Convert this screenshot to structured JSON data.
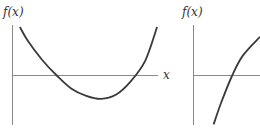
{
  "chart_data": [
    {
      "type": "line",
      "title": "",
      "ylabel": "f(x)",
      "xlabel": "x",
      "grid": false,
      "description": "Upward-opening parabola crossing the x-axis twice with a minimum below the axis",
      "xlim": [
        0,
        10
      ],
      "ylim": [
        -3,
        5
      ],
      "series": [
        {
          "name": "f(x)",
          "x": [
            0.5,
            1.0,
            2.0,
            3.0,
            4.0,
            5.0,
            6.0,
            7.0,
            8.0,
            9.0,
            9.8
          ],
          "y": [
            4.9,
            3.6,
            1.6,
            0.0,
            -1.3,
            -2.0,
            -2.3,
            -1.9,
            -0.6,
            1.5,
            4.9
          ]
        }
      ]
    },
    {
      "type": "line",
      "title": "",
      "ylabel": "f(x)",
      "xlabel": "",
      "grid": false,
      "description": "Increasing concave-down curve crossing the x-axis once",
      "xlim": [
        0,
        4.3
      ],
      "ylim": [
        -3.2,
        3.2
      ],
      "series": [
        {
          "name": "f(x)",
          "x": [
            1.3,
            1.8,
            2.5,
            3.2,
            4.3
          ],
          "y": [
            -3.1,
            -1.7,
            0.0,
            1.3,
            2.5
          ]
        }
      ]
    }
  ],
  "labels": {
    "left_ylabel": "f(x)",
    "left_xlabel": "x",
    "right_ylabel": "f(x)"
  }
}
